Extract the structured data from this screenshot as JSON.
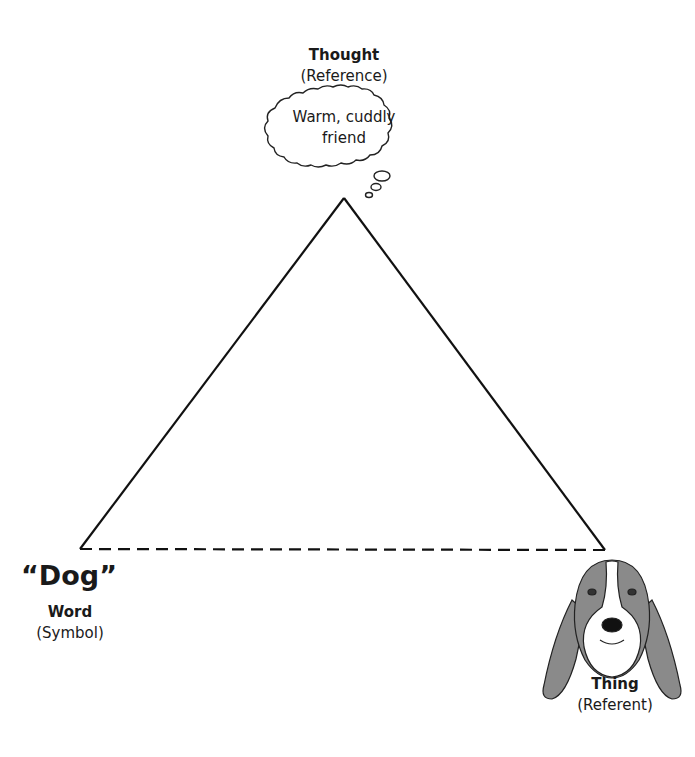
{
  "diagram": {
    "apex": {
      "label": "Thought",
      "sublabel": "(Reference)",
      "bubble_line1": "Warm, cuddly",
      "bubble_line2": "friend"
    },
    "left": {
      "word": "“Dog”",
      "label": "Word",
      "sublabel": "(Symbol)"
    },
    "right": {
      "label": "Thing",
      "sublabel": "(Referent)",
      "image": "basset-hound-drawing"
    },
    "edges": [
      {
        "from": "thought",
        "to": "word",
        "style": "solid"
      },
      {
        "from": "thought",
        "to": "thing",
        "style": "solid"
      },
      {
        "from": "word",
        "to": "thing",
        "style": "dashed"
      }
    ],
    "colors": {
      "line": "#111111",
      "dog_fur": "#8a8a8a",
      "dog_white": "#ffffff"
    }
  }
}
